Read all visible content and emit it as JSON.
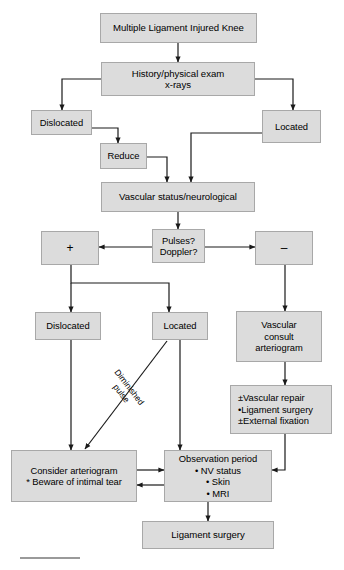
{
  "diagram": {
    "box_fill": "#dcdcdc",
    "box_border": "#a8a8a8",
    "line_color": "#1a1a1a",
    "nodes": {
      "root": {
        "label": "Multiple Ligament Injured Knee"
      },
      "history": {
        "line1": "History/physical exam",
        "line2": "x-rays"
      },
      "dislocated_top": {
        "label": "Dislocated"
      },
      "located_top": {
        "label": "Located"
      },
      "reduce": {
        "label": "Reduce"
      },
      "vascular_status": {
        "label": "Vascular status/neurological"
      },
      "pulses": {
        "line1": "Pulses?",
        "line2": "Doppler?"
      },
      "positive": {
        "label": "+"
      },
      "negative": {
        "label": "–"
      },
      "dislocated_mid": {
        "label": "Dislocated"
      },
      "located_mid": {
        "label": "Located"
      },
      "vascular_consult": {
        "line1": "Vascular",
        "line2": "consult",
        "line3": "arteriogram"
      },
      "vascular_repair": {
        "line1": "±Vascular repair",
        "line2": "•Ligament surgery",
        "line3": "±External fixation"
      },
      "consider_arteriogram": {
        "line1": "Consider arteriogram",
        "line2": "* Beware of intimal tear"
      },
      "observation": {
        "line1": "Observation period",
        "line2": "• NV status",
        "line3": "• Skin",
        "line4": "• MRI"
      },
      "ligament_surgery": {
        "label": "Ligament surgery"
      }
    },
    "edge_labels": {
      "diminished_pulse": {
        "line1": "Diminished",
        "line2": "pulse"
      }
    }
  }
}
